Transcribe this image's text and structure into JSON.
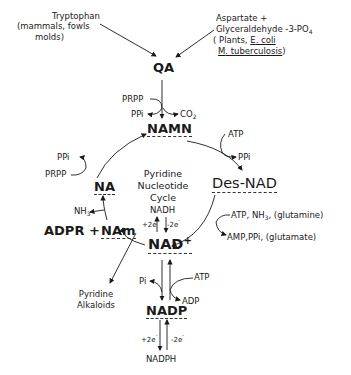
{
  "diagram": {
    "title": "Pyridine Nucleotide Cycle",
    "sources": {
      "tryptophan": {
        "name": "Tryptophan",
        "organisms": "(mammals, fowls",
        "organisms2": "molds)"
      },
      "aspartate": {
        "line1": "Aspartate +",
        "line2": "Glyceraldehyde -3-PO",
        "line2_sub": "4",
        "org_open": "( Plants, ",
        "org_ecoli_e": "E",
        "org_ecoli_rest": ". coli",
        "org_mtb_m": "M",
        "org_mtb_rest": ". tuberculosis",
        "org_close": ")"
      }
    },
    "nodes": {
      "qa": "QA",
      "namn": "NAMN",
      "desnad": "Des-NAD",
      "nad": "NAD",
      "nad_sup": "+",
      "nadh": "NADH",
      "nadp": "NADP",
      "nadph": "NADPH",
      "na": "NA",
      "adpr_nam": "ADPR + ",
      "nam": "NAm",
      "alkaloids1": "Pyridine",
      "alkaloids2": "Alkaloids"
    },
    "center_label": [
      "Pyridine",
      "Nucleotide",
      "Cycle"
    ],
    "reactants": {
      "qa_to_namn_in": "PRPP",
      "qa_to_namn_out1": "PPi",
      "qa_to_namn_out2": "CO",
      "qa_to_namn_out2_sub": "2",
      "namn_to_desnad_in": "ATP",
      "namn_to_desnad_out": "PPi",
      "desnad_to_nad_in": "ATP, NH",
      "desnad_to_nad_in_sub": "3",
      "desnad_to_nad_in_rest": ", (glutamine)",
      "desnad_to_nad_out": "AMP,PPi, (glutamate)",
      "na_to_namn_in": "PRPP",
      "na_to_namn_out": "PPi",
      "nam_to_na_out": "NH",
      "nam_to_na_out_sub": "3",
      "nad_to_nadp_in": "ATP",
      "nad_to_nadp_out": "ADP",
      "nadp_to_nad_out": "Pi",
      "plus2e": "+2e",
      "minus2e": "-2e",
      "e_sup": "-"
    }
  }
}
